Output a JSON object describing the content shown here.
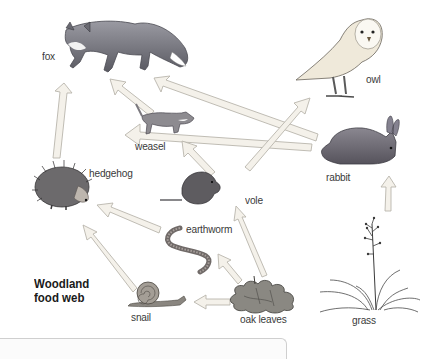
{
  "diagram": {
    "title_line1": "Woodland",
    "title_line2": "food web",
    "organisms": [
      {
        "id": "fox",
        "label": "fox",
        "role": "top predator"
      },
      {
        "id": "owl",
        "label": "owl",
        "role": "top predator"
      },
      {
        "id": "weasel",
        "label": "weasel",
        "role": "predator"
      },
      {
        "id": "rabbit",
        "label": "rabbit",
        "role": "herbivore"
      },
      {
        "id": "hedgehog",
        "label": "hedgehog",
        "role": "predator"
      },
      {
        "id": "vole",
        "label": "vole",
        "role": "herbivore"
      },
      {
        "id": "earthworm",
        "label": "earthworm",
        "role": "decomposer"
      },
      {
        "id": "snail",
        "label": "snail",
        "role": "herbivore"
      },
      {
        "id": "oak_leaves",
        "label": "oak leaves",
        "role": "producer"
      },
      {
        "id": "grass",
        "label": "grass",
        "role": "producer"
      }
    ],
    "links": [
      {
        "from": "hedgehog",
        "to": "fox"
      },
      {
        "from": "weasel",
        "to": "fox"
      },
      {
        "from": "rabbit",
        "to": "fox"
      },
      {
        "from": "vole",
        "to": "owl"
      },
      {
        "from": "rabbit",
        "to": "weasel"
      },
      {
        "from": "vole",
        "to": "weasel"
      },
      {
        "from": "earthworm",
        "to": "hedgehog"
      },
      {
        "from": "snail",
        "to": "hedgehog"
      },
      {
        "from": "oak_leaves",
        "to": "vole"
      },
      {
        "from": "oak_leaves",
        "to": "earthworm"
      },
      {
        "from": "oak_leaves",
        "to": "snail"
      },
      {
        "from": "grass",
        "to": "rabbit"
      }
    ],
    "colors": {
      "arrow_fill": "#f4f1ea",
      "arrow_stroke": "#b9b5ad",
      "label_text": "#3a3a3a",
      "title_text": "#1a1a1a"
    }
  }
}
